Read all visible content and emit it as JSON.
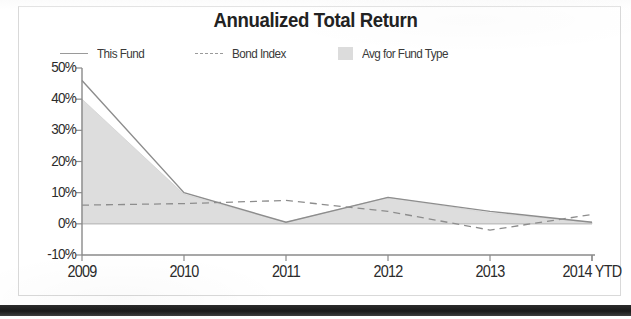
{
  "chart_data": {
    "type": "area",
    "title": "Annualized Total Return",
    "xlabel": "",
    "ylabel": "",
    "categories": [
      "2009",
      "2010",
      "2011",
      "2012",
      "2013",
      "2014 YTD"
    ],
    "ylim": [
      -10,
      50
    ],
    "ytick_labels": [
      "50%",
      "40%",
      "30%",
      "20%",
      "10%",
      "0%",
      "-10%"
    ],
    "ytick_values": [
      50,
      40,
      30,
      20,
      10,
      0,
      -10
    ],
    "grid": false,
    "legend_position": "top",
    "series": [
      {
        "name": "This Fund",
        "style": "solid-line",
        "color": "#8d8d8d",
        "values": [
          46,
          10,
          0.5,
          8.5,
          4,
          0.5
        ]
      },
      {
        "name": "Bond Index",
        "style": "dashed-line",
        "color": "#8d8d8d",
        "values": [
          6,
          6.5,
          7.5,
          4,
          -2,
          3
        ]
      },
      {
        "name": "Avg for Fund Type",
        "style": "filled-area",
        "color": "#dcdcdc",
        "values": [
          40,
          9.5,
          0.5,
          8.5,
          3.5,
          0.5
        ]
      }
    ]
  },
  "legend": {
    "items": [
      {
        "label": "This Fund",
        "swatch": "line-swatch-icon"
      },
      {
        "label": "Bond Index",
        "swatch": "dashed-line-swatch-icon"
      },
      {
        "label": "Avg for Fund Type",
        "swatch": "filled-square-swatch-icon"
      }
    ]
  },
  "colors": {
    "axis": "#8a8a8a",
    "area_fill": "#dcdcdc",
    "line": "#8d8d8d",
    "text": "#2b2b2b",
    "frame": "#d9d9d9",
    "bottom_bar": "#1f1f1f"
  }
}
